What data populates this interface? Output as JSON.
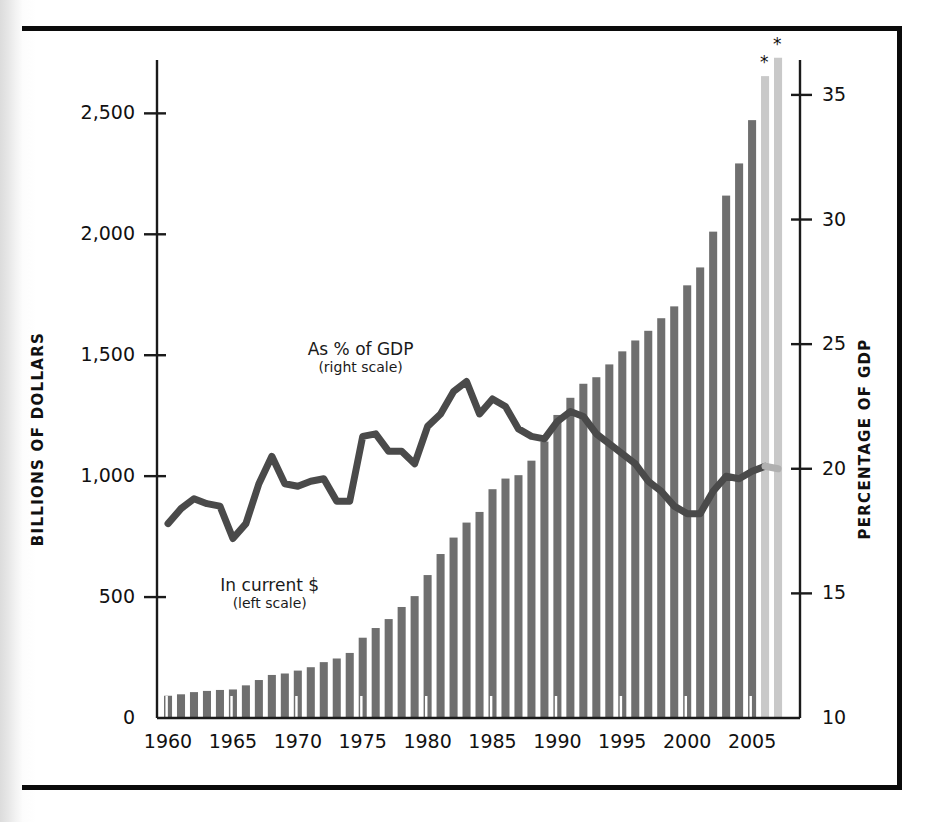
{
  "figure": {
    "left_axis_title": "BILLIONS OF DOLLARS",
    "right_axis_title": "PERCENTAGE OF GDP",
    "annotation_bars_line1": "In current $",
    "annotation_bars_line2": "(left scale)",
    "annotation_line_line1": "As % of GDP",
    "annotation_line_line2": "(right scale)",
    "projection_marker": "*",
    "colors": {
      "bar_actual": "#6f6f6f",
      "bar_projected": "#c9c9c9",
      "line_actual": "#4a4a4a",
      "line_projected": "#b0b0b0",
      "axis": "#1a1a1a",
      "frame": "#0b0b0b",
      "background": "#ffffff"
    }
  },
  "chart_data": {
    "type": "bar",
    "title": "",
    "subtitle": "",
    "xlabel": "",
    "ylabel": "BILLIONS OF DOLLARS",
    "y2label": "PERCENTAGE OF GDP",
    "ylim": [
      0,
      2700
    ],
    "y2lim": [
      10,
      36.2
    ],
    "ytick_labels": [
      "0",
      "500",
      "1,000",
      "1,500",
      "2,000",
      "2,500"
    ],
    "ytick_values": [
      0,
      500,
      1000,
      1500,
      2000,
      2500
    ],
    "y2tick_labels": [
      "10",
      "15",
      "20",
      "25",
      "30",
      "35"
    ],
    "y2tick_values": [
      10,
      15,
      20,
      25,
      30,
      35
    ],
    "xtick_labels": [
      "1960",
      "1965",
      "1970",
      "1975",
      "1980",
      "1985",
      "1990",
      "1995",
      "2000",
      "2005"
    ],
    "xtick_values": [
      1960,
      1965,
      1970,
      1975,
      1980,
      1985,
      1990,
      1995,
      2000,
      2005
    ],
    "grid": false,
    "legend": "inline-annotations",
    "x": [
      1960,
      1961,
      1962,
      1963,
      1964,
      1965,
      1966,
      1967,
      1968,
      1969,
      1970,
      1971,
      1972,
      1973,
      1974,
      1975,
      1976,
      1977,
      1978,
      1979,
      1980,
      1981,
      1982,
      1983,
      1984,
      1985,
      1986,
      1987,
      1988,
      1989,
      1990,
      1991,
      1992,
      1993,
      1994,
      1995,
      1996,
      1997,
      1998,
      1999,
      2000,
      2001,
      2002,
      2003,
      2004,
      2005,
      2006,
      2007
    ],
    "series": [
      {
        "name": "In current $",
        "axis": "left",
        "units": "billions of dollars",
        "type": "bar",
        "values": [
          92,
          98,
          107,
          112,
          116,
          118,
          135,
          157,
          178,
          184,
          196,
          210,
          231,
          246,
          269,
          332,
          372,
          409,
          459,
          504,
          591,
          678,
          746,
          808,
          852,
          946,
          990,
          1004,
          1064,
          1143,
          1253,
          1324,
          1382,
          1409,
          1462,
          1516,
          1561,
          1601,
          1653,
          1702,
          1789,
          1863,
          2011,
          2160,
          2293,
          2472,
          2654,
          2730
        ],
        "projected_from": 2006
      },
      {
        "name": "As % of GDP",
        "axis": "right",
        "units": "percent of GDP",
        "type": "line",
        "values": [
          17.8,
          18.4,
          18.8,
          18.6,
          18.5,
          17.2,
          17.8,
          19.4,
          20.5,
          19.4,
          19.3,
          19.5,
          19.6,
          18.7,
          18.7,
          21.3,
          21.4,
          20.7,
          20.7,
          20.2,
          21.7,
          22.2,
          23.1,
          23.5,
          22.2,
          22.8,
          22.5,
          21.6,
          21.3,
          21.2,
          21.9,
          22.3,
          22.1,
          21.4,
          21.0,
          20.6,
          20.2,
          19.5,
          19.1,
          18.5,
          18.2,
          18.2,
          19.1,
          19.7,
          19.6,
          19.9,
          20.1,
          20.0
        ],
        "projected_from": 2006
      }
    ],
    "notes": [
      "Last two years (2006, 2007) are estimates, marked with an asterisk and drawn in a lighter tone."
    ]
  }
}
